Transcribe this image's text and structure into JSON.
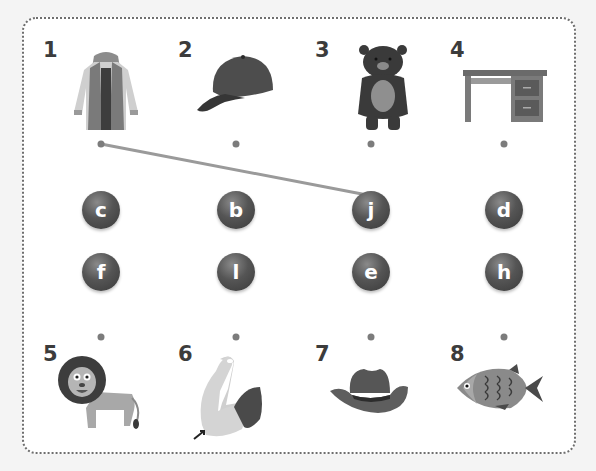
{
  "activity": {
    "type": "matching",
    "top_items": [
      {
        "number": "1",
        "picture": "jacket"
      },
      {
        "number": "2",
        "picture": "baseball-cap"
      },
      {
        "number": "3",
        "picture": "bear"
      },
      {
        "number": "4",
        "picture": "desk"
      }
    ],
    "bottom_items": [
      {
        "number": "5",
        "picture": "lion"
      },
      {
        "number": "6",
        "picture": "elbow"
      },
      {
        "number": "7",
        "picture": "cowboy-hat"
      },
      {
        "number": "8",
        "picture": "fish"
      }
    ],
    "letters_row1": [
      "c",
      "b",
      "j",
      "d"
    ],
    "letters_row2": [
      "f",
      "l",
      "e",
      "h"
    ],
    "connections": [
      {
        "from": "1",
        "to": "j"
      }
    ]
  },
  "colors": {
    "letter_ball": "#4a4a4a",
    "connector_line": "#9a9a9a",
    "dot": "#7c7c7c"
  }
}
